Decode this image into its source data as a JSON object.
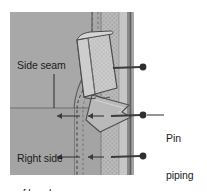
{
  "figure": {
    "name": "pin-piping-to-band-diagram",
    "type": "sewing-illustration",
    "caption_labels": {
      "side_seam": "Side seam",
      "right_side_of_band_line1": "Right side",
      "right_side_of_band_line2": "of band",
      "pin_piping_line1": "Pin",
      "pin_piping_line2": "piping",
      "pin_piping_line3": "to",
      "pin_piping_line4": "band"
    },
    "parts": {
      "band_fabric": "right-side-of-band-fabric",
      "piping_strip": "vertical-piping-strip",
      "folded_flap": "folded-back-piping-end",
      "side_seam_line": "horizontal-side-seam",
      "stitch_line": "dashed-stitching-line",
      "pin_top": "pin-top",
      "pin_middle": "pin-middle",
      "pin_bottom": "pin-bottom",
      "arrow_middle": "seam-allowance-arrow-middle",
      "arrow_bottom": "seam-allowance-arrow-bottom"
    },
    "colors": {
      "page_background": "#ffffff",
      "fabric_gray": "#a8a8a8",
      "fabric_gray_dark": "#9c9c9c",
      "piping_light": "#c3c3c3",
      "piping_texture": "#8f8f8f",
      "flap_light": "#cbcbcb",
      "outline": "#4a4a4a",
      "edge_dark": "#5d5d5d",
      "pin_color": "#3b3b3b",
      "text": "#1c1c1c"
    }
  }
}
